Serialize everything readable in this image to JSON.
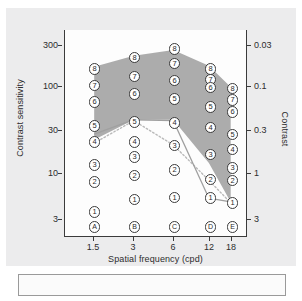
{
  "chart_data": {
    "type": "scatter",
    "title": "",
    "xlabel": "Spatial frequency (cpd)",
    "ylabel": "Contrast sensitivity",
    "ylabel_right": "Contrast",
    "x_ticks": [
      "1.5",
      "3",
      "6",
      "12",
      "18"
    ],
    "x_values": [
      1.5,
      3,
      6,
      12,
      18
    ],
    "y_ticks_left": [
      "300",
      "100",
      "30",
      "10",
      "3"
    ],
    "y_values_left": [
      300,
      100,
      30,
      10,
      3
    ],
    "y_ticks_right": [
      "0.03",
      "0.1",
      "0.3",
      "1",
      "3"
    ],
    "y_values_right": [
      0.03,
      0.1,
      0.3,
      1,
      3
    ],
    "yscale": "log",
    "xscale": "log",
    "ylim_left": [
      2.4,
      420
    ],
    "grid": false,
    "legend": "none",
    "column_letters": [
      "A",
      "B",
      "C",
      "D",
      "E"
    ],
    "marker_style": "circled-digit",
    "columns": [
      {
        "letter": "A",
        "x": "1.5",
        "levels": [
          "8",
          "7",
          "6",
          "5",
          "4",
          "3",
          "2",
          "1"
        ],
        "sensitivities": [
          160,
          103,
          66,
          35,
          23,
          12.5,
          8.0,
          3.6
        ]
      },
      {
        "letter": "B",
        "x": "3",
        "levels": [
          "8",
          "7",
          "6",
          "5",
          "4",
          "3",
          "2",
          "1"
        ],
        "sensitivities": [
          215,
          130,
          82,
          39,
          23,
          15.5,
          9.5,
          5.0
        ]
      },
      {
        "letter": "C",
        "x": "6",
        "levels": [
          "8",
          "7",
          "6",
          "5",
          "4",
          "3",
          "2",
          "1"
        ],
        "sensitivities": [
          270,
          185,
          118,
          72,
          38,
          21,
          11,
          5.3
        ]
      },
      {
        "letter": "D",
        "x": "12",
        "levels": [
          "8",
          "7",
          "6",
          "5",
          "4",
          "3",
          "2",
          "1"
        ],
        "sensitivities": [
          160,
          120,
          98,
          58,
          34,
          16.5,
          8.5,
          5.2
        ]
      },
      {
        "letter": "E",
        "x": "18",
        "levels": [
          "8",
          "7",
          "6",
          "5",
          "4",
          "3",
          "2",
          "1"
        ],
        "sensitivities": [
          95,
          70,
          51,
          28,
          19,
          11.5,
          8.3,
          4.6
        ]
      }
    ],
    "band": {
      "name": "normal-range-band",
      "fill": "#a8a8a8",
      "upper_sensitivities": [
        168,
        225,
        262,
        172,
        98
      ],
      "lower_sensitivities": [
        24,
        41,
        41,
        13,
        4.6
      ]
    },
    "series": [
      {
        "name": "solid-curve",
        "style": "solid",
        "color": "#9c9c9c",
        "x": [
          1.5,
          3,
          6,
          12,
          18
        ],
        "values": [
          28,
          41,
          40,
          5.1,
          4.6
        ]
      },
      {
        "name": "dotted-curve",
        "style": "dotted",
        "color": "#b5b5b5",
        "x": [
          1.5,
          3,
          6,
          12,
          18
        ],
        "values": [
          22,
          40,
          21,
          8.2,
          4.5
        ]
      }
    ]
  },
  "caption": {
    "text": ""
  }
}
